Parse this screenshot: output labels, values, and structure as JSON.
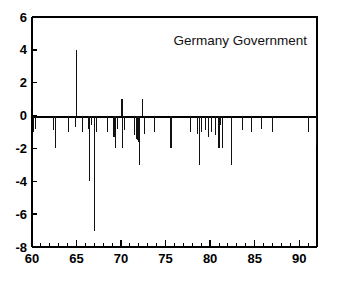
{
  "chart_data": {
    "type": "bar",
    "title": "Germany Government",
    "subtitle": "",
    "xlabel": "",
    "ylabel": "",
    "xlim": [
      60,
      92
    ],
    "ylim": [
      -8,
      6
    ],
    "grid": false,
    "legend": null,
    "x_ticks_major": [
      60,
      65,
      70,
      75,
      80,
      85,
      90
    ],
    "x_tick_labels": [
      "60",
      "65",
      "70",
      "75",
      "80",
      "85",
      "90"
    ],
    "x_ticks_minor": [
      61,
      62,
      63,
      64,
      66,
      67,
      68,
      69,
      71,
      72,
      73,
      74,
      76,
      77,
      78,
      79,
      81,
      82,
      83,
      84,
      86,
      87,
      88,
      89,
      91,
      92
    ],
    "y_ticks_major": [
      -8,
      -6,
      -4,
      -2,
      0,
      2,
      4,
      6
    ],
    "y_tick_labels": [
      "-8",
      "-6",
      "-4",
      "-2",
      "0",
      "2",
      "4",
      "6"
    ],
    "series_name": "Germany Government",
    "x": [
      60.2,
      60.4,
      62.4,
      62.6,
      64.1,
      64.9,
      65.0,
      65.7,
      66.3,
      66.5,
      66.7,
      67.0,
      67.2,
      68.5,
      69.2,
      69.4,
      69.6,
      70.1,
      70.2,
      70.4,
      71.5,
      71.7,
      71.9,
      72.0,
      72.1,
      72.4,
      72.6,
      73.8,
      75.6,
      77.8,
      78.6,
      78.8,
      79.0,
      79.5,
      79.8,
      80.2,
      80.6,
      81.0,
      81.2,
      81.4,
      82.4,
      83.6,
      84.6,
      85.8,
      87.0,
      91.0,
      91.9
    ],
    "values": [
      -1.0,
      -0.8,
      -0.9,
      -2.0,
      -1.0,
      -0.7,
      4.0,
      -1.0,
      -0.8,
      -4.0,
      -0.6,
      -7.0,
      -1.0,
      -1.0,
      -1.3,
      -2.0,
      -0.8,
      1.0,
      -2.0,
      -0.9,
      -1.2,
      -1.4,
      -1.5,
      -1.6,
      -3.0,
      1.0,
      -1.1,
      -1.0,
      -2.0,
      -1.0,
      -1.1,
      -3.0,
      -1.0,
      -0.9,
      -1.3,
      -1.0,
      -1.2,
      -2.0,
      -0.6,
      -2.0,
      -3.0,
      -0.9,
      -1.0,
      -0.8,
      -1.0,
      -1.0,
      -1.8
    ],
    "baseline": 0
  },
  "annotations": {
    "title_position": "top-right-inside"
  }
}
